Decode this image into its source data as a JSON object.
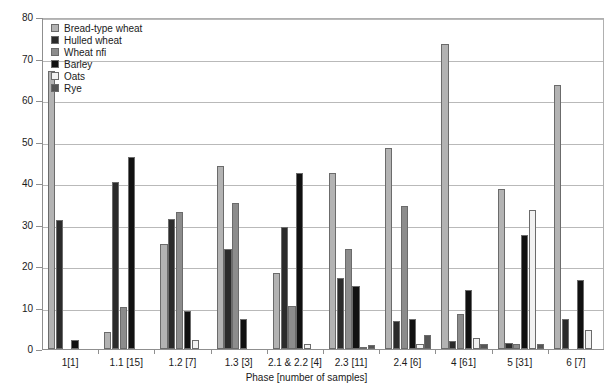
{
  "chart_data": {
    "type": "bar",
    "title": "",
    "xlabel": "Phase [number of samples]",
    "ylabel": "",
    "ylim": [
      0,
      80
    ],
    "ytick_step": 10,
    "yticks": [
      0,
      10,
      20,
      30,
      40,
      50,
      60,
      70,
      80
    ],
    "grid": true,
    "legend_position": "top-left",
    "categories": [
      "1[1]",
      "1.1 [15]",
      "1.2 [7]",
      "1.3 [3]",
      "2.1 & 2.2 [4]",
      "2.3 [11]",
      "2.4 [6]",
      "4 [61]",
      "5 [31]",
      "6 [7]"
    ],
    "series": [
      {
        "name": "Bread-type wheat",
        "color": "#b3b3b3",
        "values": [
          67.0,
          4.2,
          25.2,
          44.2,
          18.3,
          42.3,
          48.4,
          73.5,
          38.6,
          63.6
        ]
      },
      {
        "name": "Hulled wheat",
        "color": "#2b2b2b",
        "values": [
          31.2,
          40.2,
          31.3,
          24.2,
          29.4,
          17.2,
          6.7,
          1.9,
          1.4,
          7.3
        ]
      },
      {
        "name": "Wheat nfi",
        "color": "#8c8c8c",
        "values": [
          0.0,
          10.2,
          33.1,
          35.3,
          10.3,
          24.1,
          34.4,
          8.5,
          1.2,
          0.0
        ]
      },
      {
        "name": "Barley",
        "color": "#111111",
        "values": [
          2.1,
          46.2,
          9.1,
          7.2,
          42.3,
          15.3,
          7.2,
          14.3,
          27.4,
          16.6
        ]
      },
      {
        "name": "Oats",
        "color": "#f2f2f2",
        "values": [
          0.0,
          0.0,
          2.2,
          0.0,
          1.2,
          0.6,
          1.2,
          2.7,
          33.5,
          4.7
        ]
      },
      {
        "name": "Rye",
        "color": "#555555",
        "values": [
          0.0,
          0.0,
          0.0,
          0.0,
          0.0,
          0.9,
          3.3,
          1.3,
          1.1,
          0.0
        ]
      }
    ]
  },
  "axis": {
    "y_tick_labels": [
      "80",
      "70",
      "60",
      "50",
      "40",
      "30",
      "20",
      "10",
      "0"
    ],
    "x_title": "Phase [number of samples]"
  },
  "legend": {
    "items": [
      {
        "label": "Bread-type wheat",
        "color": "#b3b3b3"
      },
      {
        "label": "Hulled wheat",
        "color": "#2b2b2b"
      },
      {
        "label": "Wheat nfi",
        "color": "#8c8c8c"
      },
      {
        "label": "Barley",
        "color": "#111111"
      },
      {
        "label": "Oats",
        "color": "#f2f2f2"
      },
      {
        "label": "Rye",
        "color": "#555555"
      }
    ]
  }
}
